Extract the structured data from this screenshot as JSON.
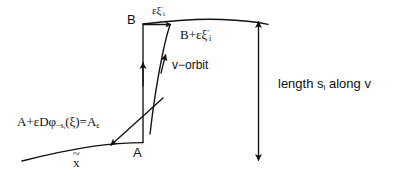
{
  "figure": {
    "background_color": "#ffffff",
    "stroke_color": "#111111",
    "width": 393,
    "height": 181
  },
  "labels": {
    "point_B": "B",
    "epsilon_xi_top": "εξ",
    "epsilon_xi_top_prime": "′",
    "epsilon_xi_top_sub": "i",
    "B_plus_prefix": "B+εξ",
    "B_plus_prime": "′",
    "B_plus_sub": "i",
    "v_orbit": "v−orbit",
    "equation_part1": "A+εDφ",
    "equation_sub_main": "−s",
    "equation_sub_sub": "i",
    "equation_part2": "(ξ)=A",
    "equation_sub_eps": "ε",
    "point_A": "A",
    "x_tilde_base": "x",
    "x_tilde_mark": "~",
    "length_prefix": "length s",
    "length_sub": "i",
    "length_suffix": " along v"
  },
  "icons": {
    "arrow_up": "arrow-up-icon",
    "arrow_down": "arrow-down-icon",
    "arrow_right": "arrow-right-icon",
    "arrow_diag": "arrow-diagonal-icon"
  }
}
